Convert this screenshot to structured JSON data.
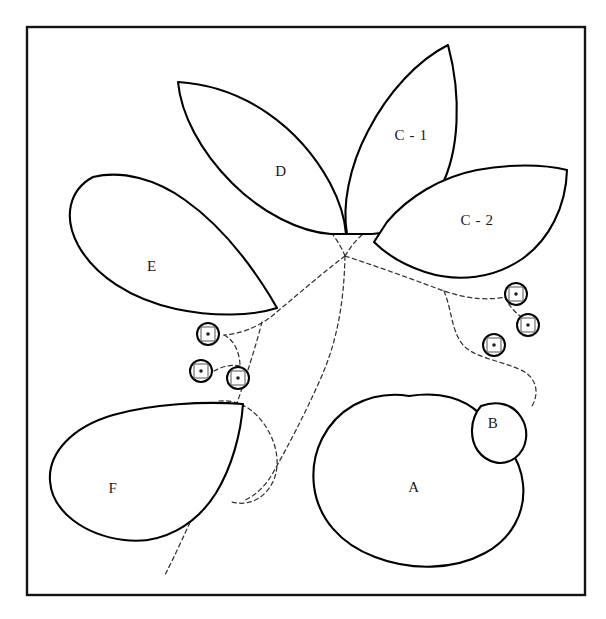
{
  "figure": {
    "background_color": "#ffffff",
    "frame": {
      "x": 27,
      "y": 27,
      "width": 558,
      "height": 568,
      "stroke_color": "#151515"
    }
  },
  "regions": [
    {
      "id": "A",
      "label": "A",
      "label_x": 414,
      "label_y": 489,
      "shape": "large-rounded-blob",
      "stroke_color": "#000000"
    },
    {
      "id": "B",
      "label": "B",
      "label_x": 493,
      "label_y": 425,
      "shape": "small-oval-lobe",
      "stroke_color": "#000000"
    },
    {
      "id": "C-1",
      "label": "C - 1",
      "label_x": 411,
      "label_y": 137,
      "shape": "upper-right-petal",
      "stroke_color": "#000000"
    },
    {
      "id": "C-2",
      "label": "C - 2",
      "label_x": 477,
      "label_y": 222,
      "shape": "right-petal",
      "stroke_color": "#000000"
    },
    {
      "id": "D",
      "label": "D",
      "label_x": 281,
      "label_y": 173,
      "shape": "upper-petal",
      "stroke_color": "#000000"
    },
    {
      "id": "E",
      "label": "E",
      "label_x": 152,
      "label_y": 268,
      "shape": "left-petal",
      "stroke_color": "#000000"
    },
    {
      "id": "F",
      "label": "F",
      "label_x": 113,
      "label_y": 490,
      "shape": "lower-left-teardrop",
      "stroke_color": "#000000"
    }
  ],
  "markers": [
    {
      "id": "marker-left-1",
      "x": 208,
      "y": 334,
      "radius": 11
    },
    {
      "id": "marker-left-2",
      "x": 201,
      "y": 371,
      "radius": 11
    },
    {
      "id": "marker-left-3",
      "x": 238,
      "y": 378,
      "radius": 11
    },
    {
      "id": "marker-right-1",
      "x": 516,
      "y": 294,
      "radius": 11
    },
    {
      "id": "marker-right-2",
      "x": 528,
      "y": 325,
      "radius": 11
    },
    {
      "id": "marker-right-3",
      "x": 494,
      "y": 345,
      "radius": 11
    }
  ],
  "connectors": {
    "style": "dashed",
    "stroke_color": "#333333",
    "hub": {
      "x": 345,
      "y": 256
    },
    "count": 9
  }
}
